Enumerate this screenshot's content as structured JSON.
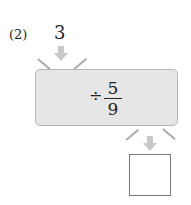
{
  "problem": {
    "label": "(2)",
    "input_value": "3",
    "operation": {
      "operator": "÷",
      "numerator": "5",
      "denominator": "9"
    },
    "answer": ""
  },
  "colors": {
    "box_fill": "#e6e6e6",
    "box_border": "#b8b8b8",
    "arrow": "#c8c8c8"
  }
}
